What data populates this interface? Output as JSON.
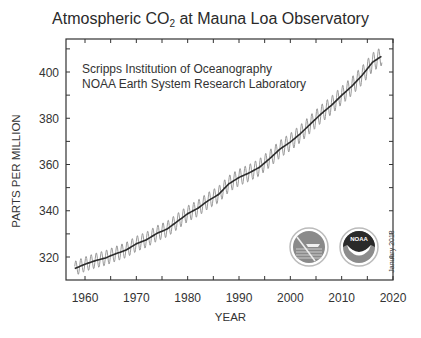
{
  "chart_data": {
    "type": "line",
    "title": "Atmospheric CO2 at Mauna Loa Observatory",
    "title_main": "Atmospheric CO",
    "title_sub": "2",
    "title_rest": " at Mauna Loa Observatory",
    "xlabel": "YEAR",
    "ylabel": "PARTS PER MILLION",
    "xlim": [
      1956.3,
      2020
    ],
    "ylim": [
      310,
      414
    ],
    "x_ticks": [
      1960,
      1970,
      1980,
      1990,
      2000,
      2010,
      2020
    ],
    "y_ticks": [
      320,
      340,
      360,
      380,
      400
    ],
    "grid": false,
    "annotations": [
      "Scripps Institution of Oceanography",
      "NOAA Earth System Research Laboratory",
      "January 2018"
    ],
    "series": [
      {
        "name": "Monthly mean (seasonal cycle)",
        "color": "#9a9a9a",
        "seasonal_amplitude_ppm": 3.2
      },
      {
        "name": "Seasonally adjusted trend",
        "color": "#2b2b2b",
        "x": [
          1958,
          1960,
          1962,
          1964,
          1966,
          1968,
          1970,
          1972,
          1974,
          1976,
          1978,
          1980,
          1982,
          1984,
          1986,
          1988,
          1990,
          1992,
          1994,
          1996,
          1998,
          2000,
          2002,
          2004,
          2006,
          2008,
          2010,
          2012,
          2014,
          2016,
          2017.9
        ],
        "values": [
          315.0,
          316.9,
          318.4,
          319.6,
          321.4,
          323.0,
          325.7,
          327.5,
          330.2,
          332.1,
          335.4,
          338.7,
          341.1,
          344.4,
          347.0,
          351.6,
          354.4,
          356.4,
          358.8,
          362.6,
          366.7,
          369.7,
          373.4,
          377.7,
          381.9,
          385.6,
          389.9,
          393.9,
          398.6,
          404.2,
          407.0
        ]
      }
    ]
  },
  "labels": {
    "credit_line1": "Scripps Institution of Oceanography",
    "credit_line2": "NOAA Earth System Research Laboratory",
    "date_note": "January 2018",
    "noaa_logo_text": "NOAA"
  }
}
